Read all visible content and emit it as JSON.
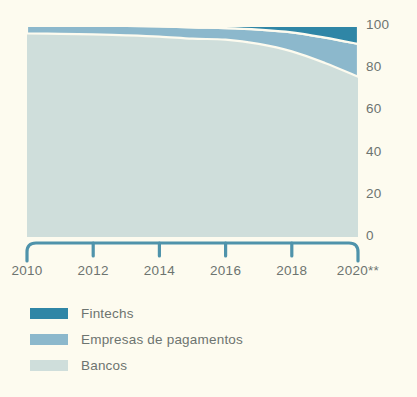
{
  "chart_data": {
    "type": "area",
    "stacked": true,
    "percent": true,
    "title": "",
    "subtitle": "",
    "xlabel": "",
    "ylabel": "",
    "xlim": [
      2010,
      2020
    ],
    "ylim": [
      0,
      100
    ],
    "grid": false,
    "legend_position": "below",
    "background_color": "#fdfbef",
    "x": [
      2010,
      2011,
      2012,
      2013,
      2014,
      2015,
      2016,
      2017,
      2018,
      2019,
      2020
    ],
    "x_tick_labels": [
      "2010",
      "2012",
      "2014",
      "2016",
      "2018",
      "2020**"
    ],
    "x_tick_values": [
      2010,
      2012,
      2014,
      2016,
      2018,
      2020
    ],
    "y_tick_labels": [
      "100",
      "80",
      "60",
      "40",
      "20",
      "0"
    ],
    "y_tick_values": [
      100,
      80,
      60,
      40,
      20,
      0
    ],
    "series": [
      {
        "name": "Bancos",
        "color": "#cfdedb",
        "values": [
          96.5,
          96.3,
          96.0,
          95.6,
          95.0,
          94.0,
          93.5,
          91.5,
          88.0,
          82.5,
          76.0
        ]
      },
      {
        "name": "Empresas de pagamentos",
        "color": "#8cb8cc",
        "values": [
          3.5,
          3.7,
          4.0,
          4.4,
          4.8,
          5.3,
          5.5,
          6.8,
          9.0,
          12.0,
          15.5
        ]
      },
      {
        "name": "Fintechs",
        "color": "#2f86a6",
        "values": [
          0.0,
          0.0,
          0.0,
          0.0,
          0.2,
          0.7,
          1.0,
          1.7,
          3.0,
          5.5,
          8.5
        ]
      }
    ]
  },
  "axis": {
    "axis_color": "#4f93ab",
    "tick_color": "#4f93ab",
    "label_color": "#6d7470"
  },
  "legend": {
    "items": [
      {
        "label": "Fintechs",
        "color": "#2f86a6"
      },
      {
        "label": "Empresas de pagamentos",
        "color": "#8cb8cc"
      },
      {
        "label": "Bancos",
        "color": "#cfdedb"
      }
    ]
  }
}
